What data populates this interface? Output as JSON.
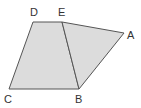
{
  "diagram": {
    "labels": {
      "A": "A",
      "B": "B",
      "C": "C",
      "D": "D",
      "E": "E"
    },
    "fill_color": "#dcdcdc",
    "stroke_color": "#555555",
    "shapes": [
      "trapezoid DEBC",
      "triangle EAB"
    ]
  }
}
